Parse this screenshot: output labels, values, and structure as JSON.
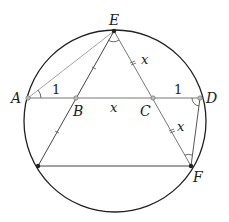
{
  "diagram": {
    "type": "geometry",
    "colors": {
      "circle": "#222222",
      "line": "#444444",
      "thin_line": "#888888",
      "point_dark": "#222222",
      "point_light": "#aaaaaa"
    },
    "circle": {
      "cx": 115,
      "cy": 121,
      "r": 91
    },
    "points": {
      "E": {
        "x": 114,
        "y": 31,
        "label": "E",
        "style": "dark"
      },
      "A": {
        "x": 28,
        "y": 98,
        "label": "A",
        "style": "light"
      },
      "B": {
        "x": 76,
        "y": 98,
        "label": "B",
        "style": "light"
      },
      "C": {
        "x": 153,
        "y": 98,
        "label": "C",
        "style": "light"
      },
      "D": {
        "x": 200,
        "y": 98,
        "label": "D",
        "style": "light"
      },
      "G": {
        "x": 38,
        "y": 166,
        "label": "",
        "style": "dark"
      },
      "F": {
        "x": 191,
        "y": 166,
        "label": "F",
        "style": "dark"
      }
    },
    "segment_labels": {
      "AB": "1",
      "BC": "x",
      "CD": "1",
      "EC": "x",
      "CF": "x"
    }
  }
}
